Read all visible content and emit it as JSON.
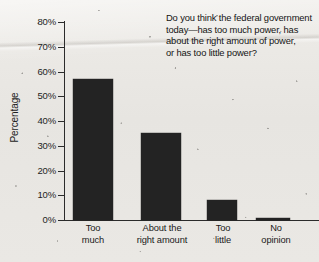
{
  "chart_data": {
    "type": "bar",
    "title": "",
    "question": {
      "lines": [
        "Do you think the federal government",
        "today—has too much power, has",
        "about the right amount of power,",
        "or has too little power?"
      ]
    },
    "categories": [
      "Too much",
      "About the right amount",
      "Too little",
      "No opinion"
    ],
    "category_lines": [
      [
        "Too",
        "much"
      ],
      [
        "About the",
        "right amount"
      ],
      [
        "Too",
        "little"
      ],
      [
        "No",
        "opinion"
      ]
    ],
    "values": [
      57,
      35,
      8,
      1
    ],
    "xlabel": "",
    "ylabel": "Percentage",
    "ylim": [
      0,
      80
    ],
    "ytick_step": 10,
    "yticks": [
      80,
      70,
      60,
      50,
      40,
      30,
      20,
      10,
      0
    ],
    "ytick_labels": [
      "80%",
      "70%",
      "60%",
      "50%",
      "40%",
      "30%",
      "20%",
      "10%",
      "0%"
    ],
    "grid": false,
    "legend": false,
    "bar_color": "#232323",
    "axis_color": "#2b2b2b",
    "background_color": "#e9e7e3"
  }
}
